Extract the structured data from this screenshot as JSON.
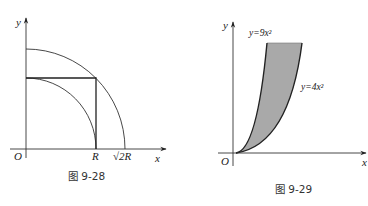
{
  "figures": [
    {
      "id": "fig-9-28",
      "caption": "图 9-28",
      "axes": {
        "x_label": "x",
        "y_label": "y",
        "origin_label": "O"
      },
      "ticks": {
        "r_label": "R",
        "sqrt2r_label": "√2R"
      },
      "elements": [
        "quarter circle radius R",
        "quarter circle radius √2R",
        "square side R"
      ]
    },
    {
      "id": "fig-9-29",
      "caption": "图 9-29",
      "axes": {
        "x_label": "x",
        "y_label": "y",
        "origin_label": "O"
      },
      "curves": [
        {
          "label": "y=9x²",
          "equation": "y=9x^2"
        },
        {
          "label": "y=4x²",
          "equation": "y=4x^2"
        }
      ],
      "shaded_region_color": "#a9a9a9",
      "line_color": "#222222"
    }
  ]
}
